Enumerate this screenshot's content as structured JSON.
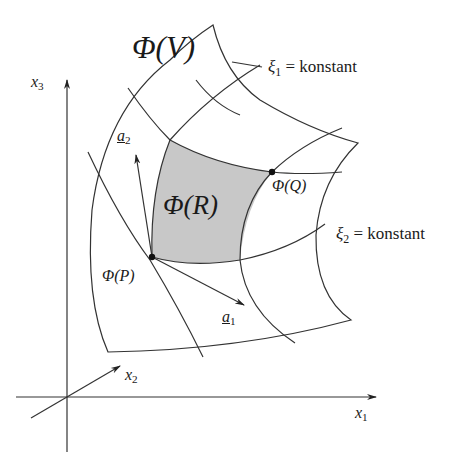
{
  "figure": {
    "colors": {
      "line": "#333333",
      "shade": "#c8c8c8",
      "background": "#ffffff"
    }
  },
  "labels": {
    "phi_v": {
      "phi": "Φ",
      "arg": "(V)"
    },
    "phi_r": {
      "phi": "Φ",
      "arg": "(R)"
    },
    "phi_q": {
      "phi": "Φ",
      "arg": "(Q)"
    },
    "phi_p": {
      "phi": "Φ",
      "arg": "(P)"
    },
    "xi1": {
      "sym": "ξ",
      "sub": "1",
      "rest": " = konstant"
    },
    "xi2": {
      "sym": "ξ",
      "sub": "2",
      "rest": " = konstant"
    },
    "a1": {
      "sym": "a",
      "sub": "1"
    },
    "a2": {
      "sym": "a",
      "sub": "2"
    },
    "x1": {
      "sym": "x",
      "sub": "1"
    },
    "x2": {
      "sym": "x",
      "sub": "2"
    },
    "x3": {
      "sym": "x",
      "sub": "3"
    }
  }
}
